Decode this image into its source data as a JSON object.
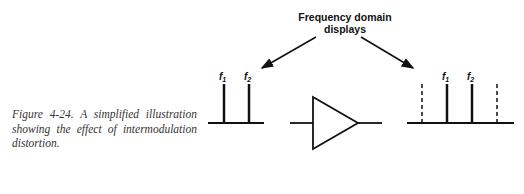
{
  "figure": {
    "caption": "Figure 4-24.  A simplified illustration showing the effect of intermodulation distortion.",
    "heading_line1": "Frequency domain",
    "heading_line2": "displays",
    "input_display": {
      "labels": [
        "f",
        "f"
      ],
      "subscripts": [
        "1",
        "2"
      ],
      "lines": [
        {
          "type": "solid",
          "label": "f1"
        },
        {
          "type": "solid",
          "label": "f2"
        }
      ]
    },
    "output_display": {
      "labels": [
        "f",
        "f"
      ],
      "subscripts": [
        "1",
        "2"
      ],
      "lines": [
        {
          "type": "dashed",
          "label": ""
        },
        {
          "type": "solid",
          "label": "f1"
        },
        {
          "type": "solid",
          "label": "f2"
        },
        {
          "type": "dashed",
          "label": ""
        }
      ]
    },
    "component": "amplifier-triangle"
  }
}
